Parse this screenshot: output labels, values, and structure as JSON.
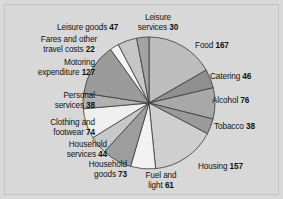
{
  "figure": {
    "background_color": "#d8d8d8",
    "border_color": "#c3c3c3",
    "title": ""
  },
  "chart_data": {
    "type": "pie",
    "title": "",
    "subtitle": "",
    "xlabel": "",
    "ylabel": "",
    "legend_position": "none",
    "grid": false,
    "start_angle_deg": 0,
    "direction": "clockwise",
    "total": 1000,
    "units": "expenditure",
    "categories": [
      "Food",
      "Catering",
      "Alcohol",
      "Tobacco",
      "Housing",
      "Fuel and light",
      "Household goods",
      "Household services",
      "Clothing and footwear",
      "Personal services",
      "Motoring expenditure",
      "Fares and other travel costs",
      "Leisure goods",
      "Leisure services"
    ],
    "values": [
      167,
      46,
      76,
      38,
      157,
      61,
      73,
      44,
      74,
      38,
      127,
      22,
      47,
      30
    ],
    "colors": [
      "#bdbdbd",
      "#8f8f8f",
      "#a8a8a8",
      "#9a9a9a",
      "#cfcfcf",
      "#f2f2f2",
      "#9d9d9d",
      "#c8c8c8",
      "#efefef",
      "#b0b0b0",
      "#9b9b9b",
      "#f4f4f4",
      "#c6c6c6",
      "#a3a3a3"
    ],
    "slice_edge_color": "#3a3a3a"
  },
  "labels": [
    {
      "name": "food",
      "text_line1": "Food",
      "text_line2": "",
      "value": "167"
    },
    {
      "name": "catering",
      "text_line1": "Catering",
      "text_line2": "",
      "value": "46"
    },
    {
      "name": "alcohol",
      "text_line1": "Alcohol",
      "text_line2": "",
      "value": "76"
    },
    {
      "name": "tobacco",
      "text_line1": "Tobacco",
      "text_line2": "",
      "value": "38"
    },
    {
      "name": "housing",
      "text_line1": "Housing",
      "text_line2": "",
      "value": "157"
    },
    {
      "name": "fuel-and-light",
      "text_line1": "Fuel and",
      "text_line2": "light",
      "value": "61"
    },
    {
      "name": "household-goods",
      "text_line1": "Household",
      "text_line2": "goods",
      "value": "73"
    },
    {
      "name": "household-services",
      "text_line1": "Household",
      "text_line2": "services",
      "value": "44"
    },
    {
      "name": "clothing-and-footwear",
      "text_line1": "Clothing and",
      "text_line2": "footwear",
      "value": "74"
    },
    {
      "name": "personal-services",
      "text_line1": "Personal",
      "text_line2": "services",
      "value": "38"
    },
    {
      "name": "motoring-expenditure",
      "text_line1": "Motoring",
      "text_line2": "expenditure",
      "value": "127"
    },
    {
      "name": "fares-travel-costs",
      "text_line1": "Fares and other",
      "text_line2": "travel costs",
      "value": "22"
    },
    {
      "name": "leisure-goods",
      "text_line1": "Leisure goods",
      "text_line2": "",
      "value": "47"
    },
    {
      "name": "leisure-services",
      "text_line1": "Leisure",
      "text_line2": "services",
      "value": "30"
    }
  ]
}
